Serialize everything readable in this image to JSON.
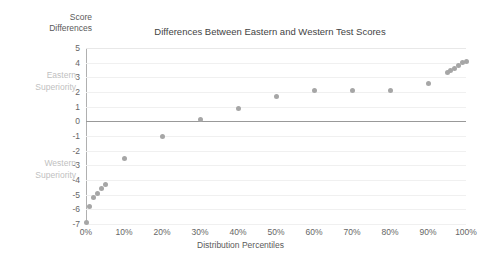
{
  "chart_data": {
    "type": "scatter",
    "title": "Differences Between Eastern and Western Test Scores",
    "xlabel": "Distribution Percentiles",
    "ylabel": "Score Differences",
    "x": [
      0,
      1,
      2,
      3,
      4,
      5,
      10,
      20,
      30,
      40,
      50,
      60,
      70,
      80,
      90,
      95,
      96,
      97,
      98,
      99,
      100
    ],
    "values": [
      -6.9,
      -5.8,
      -5.2,
      -4.9,
      -4.6,
      -4.3,
      -2.5,
      -1.0,
      0.1,
      0.9,
      1.7,
      2.1,
      2.1,
      2.1,
      2.6,
      3.3,
      3.5,
      3.6,
      3.8,
      4.0,
      4.1
    ],
    "xticks": [
      "0%",
      "10%",
      "20%",
      "30%",
      "40%",
      "50%",
      "60%",
      "70%",
      "80%",
      "90%",
      "100%"
    ],
    "xtick_values": [
      0,
      10,
      20,
      30,
      40,
      50,
      60,
      70,
      80,
      90,
      100
    ],
    "yticks": [
      "5",
      "4",
      "3",
      "2",
      "1",
      "0",
      "-1",
      "-2",
      "-3",
      "-4",
      "-5",
      "-6",
      "-7"
    ],
    "ytick_values": [
      5,
      4,
      3,
      2,
      1,
      0,
      -1,
      -2,
      -3,
      -4,
      -5,
      -6,
      -7
    ],
    "xlim": [
      0,
      100
    ],
    "ylim": [
      -7,
      5
    ],
    "grid": true,
    "legend": "none",
    "zero_line": 0,
    "marker_color": "#a6a6a6",
    "gridline_color": "#f0f0f0",
    "zero_line_color": "#999999",
    "annotations": [
      {
        "name": "eastern-superiority",
        "line1": "Eastern",
        "line2": "Superiority",
        "at_y": 2.5,
        "color": "#bfbfbf"
      },
      {
        "name": "western-superiority",
        "line1": "Western",
        "line2": "Superiority",
        "at_y": -3.5,
        "color": "#bfbfbf"
      }
    ]
  },
  "chart": {
    "title": "Differences Between Eastern and Western Test Scores",
    "y_axis_title_line1": "Score",
    "y_axis_title_line2": "Differences",
    "x_axis_title": "Distribution Percentiles",
    "eastern_line1": "Eastern",
    "eastern_line2": "Superiority",
    "western_line1": "Western",
    "western_line2": "Superiority"
  }
}
